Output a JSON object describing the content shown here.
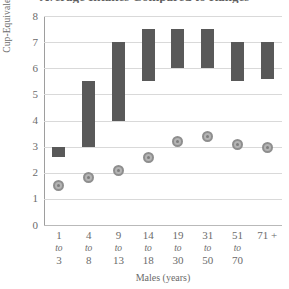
{
  "chart_data": {
    "type": "bar",
    "title": "Average Intakes Compared to Ranges",
    "xlabel": "Males (years)",
    "ylabel": "Cup-Equivalents",
    "ylim": [
      0,
      8
    ],
    "yticks": [
      0,
      1,
      2,
      3,
      4,
      5,
      6,
      7,
      8
    ],
    "grid": true,
    "legend": "none",
    "categories": [
      {
        "top": "1",
        "mid": "to",
        "bot": "3"
      },
      {
        "top": "4",
        "mid": "to",
        "bot": "8"
      },
      {
        "top": "9",
        "mid": "to",
        "bot": "13"
      },
      {
        "top": "14",
        "mid": "to",
        "bot": "18"
      },
      {
        "top": "19",
        "mid": "to",
        "bot": "30"
      },
      {
        "top": "31",
        "mid": "to",
        "bot": "50"
      },
      {
        "top": "51",
        "mid": "to",
        "bot": "70"
      },
      {
        "top": "71 +",
        "mid": "",
        "bot": ""
      }
    ],
    "series": [
      {
        "name": "Recommended Range",
        "type": "range-bar",
        "color": "#595959",
        "low": [
          2.6,
          3.0,
          4.0,
          5.5,
          6.0,
          6.0,
          5.5,
          5.6
        ],
        "high": [
          3.0,
          5.5,
          7.0,
          7.5,
          7.5,
          7.5,
          7.0,
          7.0
        ]
      },
      {
        "name": "Average Intake",
        "type": "marker",
        "color": "#b4b4b4",
        "values": [
          1.5,
          1.8,
          2.1,
          2.6,
          3.2,
          3.4,
          3.1,
          2.95
        ]
      }
    ],
    "colors": {
      "bar": "#595959",
      "marker_fill": "#b4b4b4",
      "marker_edge": "#8e8e8e",
      "gridline": "#d9d9d9",
      "axis": "#9e9e9e",
      "text": "#6b6b6b",
      "background": "#ffffff"
    }
  }
}
